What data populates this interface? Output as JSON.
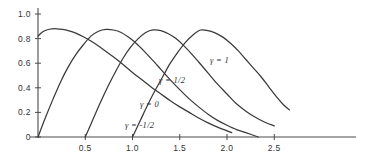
{
  "chart_data": {
    "type": "line",
    "title": "",
    "xlabel": "",
    "ylabel": "",
    "xlim": [
      -0.02,
      2.72
    ],
    "ylim": [
      0,
      1.05
    ],
    "grid": false,
    "legend_position": "inline-annotations",
    "x_ticks": [
      "0.5",
      "1.0",
      "1.5",
      "2.0",
      "2.5"
    ],
    "x_tick_values": [
      0.5,
      1.0,
      1.5,
      2.0,
      2.5
    ],
    "y_ticks": [
      "0",
      "0.2",
      "0.4",
      "0.6",
      "0.8",
      "1.0"
    ],
    "y_tick_values": [
      0,
      0.2,
      0.4,
      0.6,
      0.8,
      1.0
    ],
    "series": [
      {
        "name": "gamma = 1",
        "label": "γ = 1",
        "peak_x": 1.72,
        "peak_y": 0.87,
        "onset_x": 1.0,
        "points": [
          [
            1.0,
            0.0
          ],
          [
            1.08,
            0.13
          ],
          [
            1.16,
            0.26
          ],
          [
            1.24,
            0.38
          ],
          [
            1.32,
            0.49
          ],
          [
            1.4,
            0.6
          ],
          [
            1.48,
            0.69
          ],
          [
            1.56,
            0.77
          ],
          [
            1.64,
            0.83
          ],
          [
            1.72,
            0.87
          ],
          [
            1.8,
            0.865
          ],
          [
            1.88,
            0.845
          ],
          [
            1.96,
            0.81
          ],
          [
            2.04,
            0.76
          ],
          [
            2.12,
            0.7
          ],
          [
            2.2,
            0.63
          ],
          [
            2.28,
            0.56
          ],
          [
            2.36,
            0.49
          ],
          [
            2.44,
            0.41
          ],
          [
            2.52,
            0.33
          ],
          [
            2.6,
            0.26
          ],
          [
            2.66,
            0.22
          ]
        ]
      },
      {
        "name": "gamma = 1/2",
        "label": "γ = 1/2",
        "peak_x": 1.22,
        "peak_y": 0.87,
        "onset_x": 0.5,
        "points": [
          [
            0.5,
            0.0
          ],
          [
            0.58,
            0.14
          ],
          [
            0.66,
            0.28
          ],
          [
            0.74,
            0.41
          ],
          [
            0.82,
            0.53
          ],
          [
            0.9,
            0.64
          ],
          [
            0.98,
            0.73
          ],
          [
            1.06,
            0.8
          ],
          [
            1.14,
            0.85
          ],
          [
            1.22,
            0.87
          ],
          [
            1.3,
            0.865
          ],
          [
            1.38,
            0.84
          ],
          [
            1.46,
            0.8
          ],
          [
            1.54,
            0.745
          ],
          [
            1.62,
            0.68
          ],
          [
            1.7,
            0.61
          ],
          [
            1.8,
            0.52
          ],
          [
            1.9,
            0.43
          ],
          [
            2.0,
            0.35
          ],
          [
            2.1,
            0.27
          ],
          [
            2.2,
            0.21
          ],
          [
            2.3,
            0.16
          ],
          [
            2.4,
            0.12
          ],
          [
            2.5,
            0.09
          ]
        ]
      },
      {
        "name": "gamma = 0",
        "label": "γ = 0",
        "peak_x": 0.72,
        "peak_y": 0.875,
        "onset_x": 0.0,
        "points": [
          [
            0.0,
            0.0
          ],
          [
            0.08,
            0.16
          ],
          [
            0.16,
            0.31
          ],
          [
            0.24,
            0.45
          ],
          [
            0.32,
            0.57
          ],
          [
            0.4,
            0.67
          ],
          [
            0.48,
            0.75
          ],
          [
            0.56,
            0.82
          ],
          [
            0.64,
            0.86
          ],
          [
            0.72,
            0.875
          ],
          [
            0.8,
            0.87
          ],
          [
            0.88,
            0.85
          ],
          [
            0.96,
            0.81
          ],
          [
            1.04,
            0.76
          ],
          [
            1.12,
            0.7
          ],
          [
            1.2,
            0.635
          ],
          [
            1.3,
            0.55
          ],
          [
            1.4,
            0.465
          ],
          [
            1.5,
            0.385
          ],
          [
            1.6,
            0.31
          ],
          [
            1.7,
            0.245
          ],
          [
            1.8,
            0.185
          ],
          [
            1.9,
            0.135
          ],
          [
            2.0,
            0.095
          ],
          [
            2.1,
            0.06
          ],
          [
            2.2,
            0.035
          ],
          [
            2.33,
            0.0
          ]
        ]
      },
      {
        "name": "gamma = -1/2",
        "label": "γ = -1/2",
        "peak_x": 0.2,
        "peak_y": 0.88,
        "onset_x": 0.0,
        "start_y": 0.82,
        "points": [
          [
            0.0,
            0.82
          ],
          [
            0.05,
            0.855
          ],
          [
            0.1,
            0.872
          ],
          [
            0.15,
            0.879
          ],
          [
            0.2,
            0.88
          ],
          [
            0.26,
            0.875
          ],
          [
            0.32,
            0.865
          ],
          [
            0.4,
            0.845
          ],
          [
            0.48,
            0.815
          ],
          [
            0.56,
            0.78
          ],
          [
            0.64,
            0.74
          ],
          [
            0.72,
            0.695
          ],
          [
            0.8,
            0.65
          ],
          [
            0.9,
            0.59
          ],
          [
            1.0,
            0.525
          ],
          [
            1.1,
            0.465
          ],
          [
            1.2,
            0.405
          ],
          [
            1.3,
            0.35
          ],
          [
            1.4,
            0.295
          ],
          [
            1.5,
            0.245
          ],
          [
            1.6,
            0.2
          ],
          [
            1.7,
            0.155
          ],
          [
            1.8,
            0.115
          ],
          [
            1.9,
            0.08
          ],
          [
            2.0,
            0.05
          ],
          [
            2.05,
            0.035
          ]
        ]
      }
    ],
    "annotations": [
      {
        "text": "γ = 1",
        "x": 1.82,
        "y": 0.6
      },
      {
        "text": "γ = 1/2",
        "x": 1.28,
        "y": 0.44
      },
      {
        "text": "γ = 0",
        "x": 1.08,
        "y": 0.245
      },
      {
        "text": "γ = -1/2",
        "x": 0.92,
        "y": 0.075
      }
    ]
  },
  "axes": {
    "y_axis_name": "y-axis",
    "x_axis_name": "x-axis"
  }
}
